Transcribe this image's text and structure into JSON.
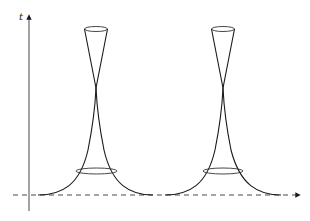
{
  "diagram": {
    "axis": {
      "label": "t",
      "x": 29,
      "y_top": 15,
      "y_bottom": 211
    },
    "baseline": {
      "y": 195,
      "x_start": 13,
      "x_end": 300,
      "style": "dashed",
      "arrow": "right"
    },
    "structures": [
      {
        "name": "left-spike",
        "center_x": 96,
        "top_ellipse": {
          "cy": 29,
          "rx": 11.5,
          "ry": 2.5
        },
        "crossing_y": 88,
        "lower_ellipse": {
          "cy": 171,
          "rx": 20.5,
          "ry": 3
        },
        "base_left_x": 38,
        "base_right_x": 153
      },
      {
        "name": "right-spike",
        "center_x": 223,
        "top_ellipse": {
          "cy": 29,
          "rx": 11.5,
          "ry": 2.5
        },
        "crossing_y": 88,
        "lower_ellipse": {
          "cy": 171,
          "rx": 20,
          "ry": 3
        },
        "base_left_x": 165,
        "base_right_x": 281
      }
    ],
    "colors": {
      "line": "#1a1a1a",
      "background": "#ffffff"
    }
  }
}
